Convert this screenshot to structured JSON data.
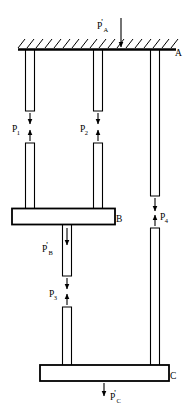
{
  "figure": {
    "type": "free-body / force-transmission diagram"
  },
  "bodies": {
    "ceiling": {
      "label": "A",
      "name": "hatched-ceiling"
    },
    "bar_b": {
      "label": "B",
      "name": "middle-bar"
    },
    "bar_c": {
      "label": "C",
      "name": "bottom-bar"
    }
  },
  "forces": {
    "pa": {
      "base": "P",
      "sub": "A",
      "prime": "'",
      "direction": "down",
      "name": "force-p-a-prime"
    },
    "pb": {
      "base": "P",
      "sub": "B",
      "prime": "'",
      "direction": "down",
      "name": "force-p-b-prime"
    },
    "pc": {
      "base": "P",
      "sub": "C",
      "prime": "'",
      "direction": "down",
      "name": "force-p-c-prime"
    },
    "p1": {
      "base": "P",
      "sub": "1",
      "prime": "",
      "direction": "pair",
      "name": "force-p-1"
    },
    "p2": {
      "base": "P",
      "sub": "2",
      "prime": "",
      "direction": "pair",
      "name": "force-p-2"
    },
    "p3": {
      "base": "P",
      "sub": "3",
      "prime": "",
      "direction": "pair",
      "name": "force-p-3"
    },
    "p4": {
      "base": "P",
      "sub": "4",
      "prime": "",
      "direction": "pair",
      "name": "force-p-4"
    }
  },
  "colors": {
    "ink": "#000000",
    "background": "#ffffff"
  }
}
